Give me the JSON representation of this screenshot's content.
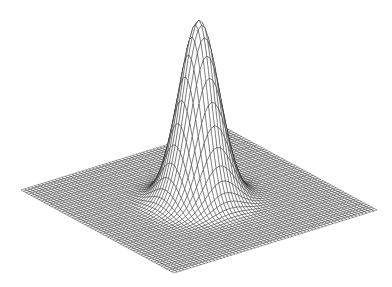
{
  "chart_data": {
    "type": "surface",
    "subtype": "3d-wireframe",
    "title": "",
    "xlabel": "",
    "ylabel": "",
    "zlabel": "",
    "function": "z = exp(-(x^2 + y^2) / (2*sigma^2))",
    "x_range": [
      -1,
      1
    ],
    "y_range": [
      -1,
      1
    ],
    "z_range": [
      0,
      1
    ],
    "sigma": 0.16,
    "peak": {
      "x": 0,
      "y": 0,
      "z": 1
    },
    "grid_resolution": 60,
    "axes_visible": false,
    "grid": false,
    "legend": "none",
    "line_color": "#1a1a1a",
    "background_color": "#ffffff"
  }
}
